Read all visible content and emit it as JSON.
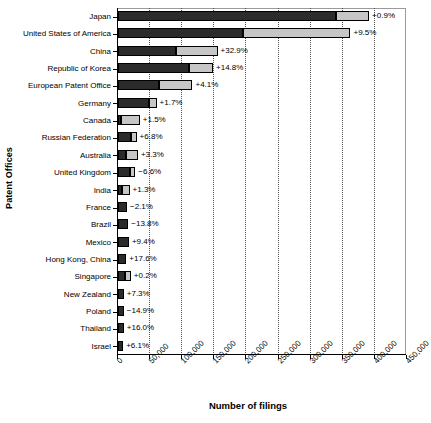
{
  "chart_data": {
    "type": "bar",
    "title": "",
    "subtitle": "",
    "xlabel": "Number of filings",
    "ylabel": "Patent Offices",
    "orientation": "horizontal",
    "stacked": true,
    "grid": true,
    "legend_position": "none",
    "xlim": [
      0,
      450000
    ],
    "xticks": [
      0,
      50000,
      100000,
      150000,
      200000,
      250000,
      300000,
      350000,
      400000,
      450000
    ],
    "xtick_labels": [
      "0",
      "50,000",
      "100,000",
      "150,000",
      "200,000",
      "250,000",
      "300,000",
      "350,000",
      "400,000",
      "450,000"
    ],
    "categories": [
      "Japan",
      "United States of America",
      "China",
      "Republic of Korea",
      "European Patent Office",
      "Germany",
      "Canada",
      "Russian Federation",
      "Australia",
      "United Kingdom",
      "India",
      "France",
      "Brazil",
      "Mexico",
      "Hong Kong, China",
      "Singapore",
      "New Zealand",
      "Poland",
      "Thailand",
      "Israel"
    ],
    "series": [
      {
        "name": "Resident filings",
        "color": "#2b2b2b",
        "values": [
          340000,
          195000,
          90000,
          110000,
          64000,
          48000,
          5000,
          21000,
          12000,
          19000,
          6000,
          14000,
          16000,
          17000,
          13000,
          11000,
          9000,
          9000,
          9000,
          8000
        ]
      },
      {
        "name": "Non-resident filings",
        "color": "#c6c6c6",
        "values": [
          51000,
          167000,
          65000,
          38000,
          52000,
          12000,
          29000,
          8000,
          19000,
          8000,
          12000,
          0,
          0,
          0,
          0,
          9000,
          0,
          0,
          0,
          0
        ]
      }
    ],
    "totals": [
      391000,
      362000,
      155000,
      148000,
      116000,
      60000,
      34000,
      29000,
      31000,
      27000,
      18000,
      14000,
      16000,
      17000,
      13000,
      12000,
      9000,
      9000,
      9000,
      8000
    ],
    "annotations": [
      "+0.9%",
      "+9.5%",
      "+32.9%",
      "+14.8%",
      "+4.1%",
      "+1.7%",
      "+1.5%",
      "+6.8%",
      "+3.3%",
      "−6.6%",
      "+1.3%",
      "−2.1%",
      "−13.8%",
      "+9.4%",
      "+17.6%",
      "+0.2%",
      "+7.3%",
      "−14.9%",
      "+16.0%",
      "+6.1%"
    ]
  },
  "colors": {
    "dark_segment": "#2b2b2b",
    "light_segment": "#c6c6c6",
    "gridline": "#555555",
    "axis": "#000000",
    "background": "#ffffff"
  }
}
